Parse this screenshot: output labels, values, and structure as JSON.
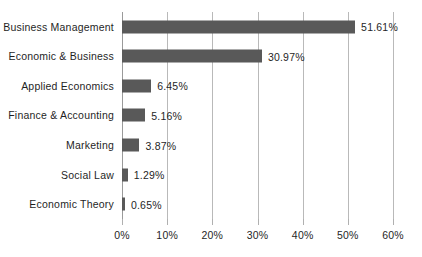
{
  "chart_data": {
    "type": "bar",
    "orientation": "horizontal",
    "title": "",
    "xlabel": "",
    "ylabel": "",
    "categories": [
      "Business Management",
      "Economic & Business",
      "Applied Economics",
      "Finance & Accounting",
      "Marketing",
      "Social Law",
      "Economic Theory"
    ],
    "values": [
      51.61,
      30.97,
      6.45,
      5.16,
      3.87,
      1.29,
      0.65
    ],
    "value_labels": [
      "51.61%",
      "30.97%",
      "6.45%",
      "5.16%",
      "3.87%",
      "1.29%",
      "0.65%"
    ],
    "xlim": [
      0,
      60
    ],
    "xticks": [
      0,
      10,
      20,
      30,
      40,
      50,
      60
    ],
    "xtick_labels": [
      "0%",
      "10%",
      "20%",
      "30%",
      "40%",
      "50%",
      "60%"
    ],
    "grid": true,
    "grid_axis": "x",
    "legend": false,
    "legend_position": "none",
    "series": [
      {
        "name": "Share",
        "values": [
          51.61,
          30.97,
          6.45,
          5.16,
          3.87,
          1.29,
          0.65
        ]
      }
    ]
  },
  "style": {
    "bar_color": "#595959",
    "gridline_color": "#b9b9b9",
    "axis_color": "#9a9a9a",
    "text_color": "#1f1f1f",
    "background": "#ffffff"
  }
}
